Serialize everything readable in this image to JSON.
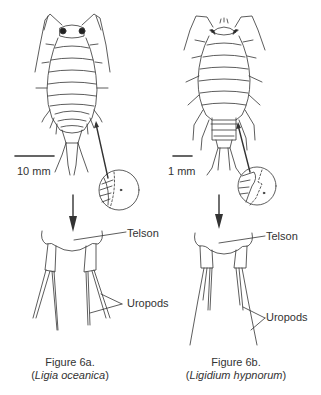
{
  "figures": [
    {
      "id": "6a",
      "scale_bar": "10 mm",
      "labels": {
        "telson": "Telson",
        "uropods": "Uropods"
      },
      "caption": {
        "line1": "Figure 6a.",
        "open": "(",
        "species": "Ligia oceanica",
        "close": ")"
      }
    },
    {
      "id": "6b",
      "scale_bar": "1 mm",
      "labels": {
        "telson": "Telson",
        "uropods": "Uropods"
      },
      "caption": {
        "line1": "Figure 6b.",
        "open": "(",
        "species": "Ligidium hypnorum",
        "close": ")"
      }
    }
  ],
  "colors": {
    "line": "#333333",
    "background": "#ffffff"
  }
}
